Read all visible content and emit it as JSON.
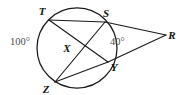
{
  "figure": {
    "kind": "circle-with-two-secants",
    "background_color": "#ffffff",
    "stroke_color": "#1a1a1a",
    "label_color": "#111111",
    "angle_label_color": "#4a4a4a",
    "circle": {
      "center_x": 77,
      "center_y": 48,
      "radius": 40
    },
    "points": [
      {
        "id": "T",
        "label": "T",
        "x": 49,
        "y": 20,
        "label_x": 42,
        "label_y": 15,
        "on_circle": true
      },
      {
        "id": "S",
        "label": "S",
        "x": 105,
        "y": 22,
        "label_x": 106,
        "label_y": 17,
        "on_circle": true
      },
      {
        "id": "Y",
        "label": "Y",
        "x": 108,
        "y": 62,
        "label_x": 112,
        "label_y": 70,
        "on_circle": true
      },
      {
        "id": "Z",
        "label": "Z",
        "x": 55,
        "y": 82,
        "label_x": 44,
        "label_y": 92,
        "on_circle": true
      },
      {
        "id": "X",
        "label": "X",
        "x": 72,
        "y": 47,
        "label_x": 67,
        "label_y": 51,
        "on_circle": false
      },
      {
        "id": "R",
        "label": "R",
        "x": 166,
        "y": 35,
        "label_x": 170,
        "label_y": 39,
        "on_circle": false
      }
    ],
    "segments": [
      {
        "id": "T-S",
        "from": "T",
        "to": "S"
      },
      {
        "id": "T-Y",
        "from": "T",
        "to": "Y"
      },
      {
        "id": "S-Z",
        "from": "S",
        "to": "Z"
      },
      {
        "id": "Z-Y",
        "from": "Z",
        "to": "Y"
      },
      {
        "id": "S-R",
        "from": "S",
        "to": "R"
      },
      {
        "id": "Y-R",
        "from": "Y",
        "to": "R"
      }
    ],
    "angle_labels": [
      {
        "id": "arc-TZ-measure",
        "text": "100°",
        "x": 10,
        "y": 45
      },
      {
        "id": "angle-R-measure",
        "text": "40°",
        "x": 110,
        "y": 45
      }
    ]
  }
}
